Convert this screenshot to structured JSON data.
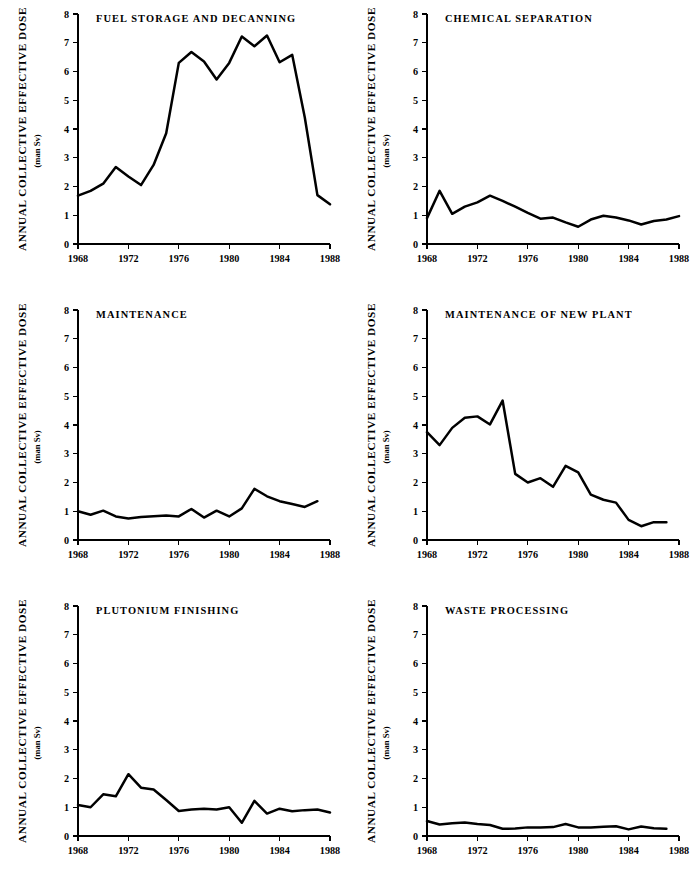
{
  "figure": {
    "panel_count": 6,
    "axis_label_y": "ANNUAL  COLLECTIVE  EFFECTIVE  DOSE",
    "axis_label_y_units": "(man Sv)",
    "y_ticks": [
      "0",
      "1",
      "2",
      "3",
      "4",
      "5",
      "6",
      "7",
      "8"
    ],
    "x_ticks": [
      "1968",
      "1972",
      "1976",
      "1980",
      "1984",
      "1988"
    ],
    "line_color": "#000000",
    "background_color": "#ffffff"
  },
  "chart_data": [
    {
      "type": "line",
      "title": "FUEL STORAGE AND DECANNING",
      "xlabel": "",
      "ylabel": "ANNUAL  COLLECTIVE  EFFECTIVE  DOSE (man Sv)",
      "xlim": [
        1968,
        1988
      ],
      "ylim": [
        0,
        8
      ],
      "grid": false,
      "legend": "none",
      "x": [
        1968,
        1969,
        1970,
        1971,
        1972,
        1973,
        1974,
        1975,
        1976,
        1977,
        1978,
        1979,
        1980,
        1981,
        1982,
        1983,
        1984,
        1985,
        1986,
        1987,
        1988
      ],
      "values": [
        1.68,
        1.85,
        2.1,
        2.68,
        2.35,
        2.05,
        2.75,
        3.85,
        6.3,
        6.68,
        6.35,
        5.72,
        6.3,
        7.22,
        6.88,
        7.25,
        6.32,
        6.58,
        4.4,
        1.7,
        1.38
      ]
    },
    {
      "type": "line",
      "title": "CHEMICAL SEPARATION",
      "xlabel": "",
      "ylabel": "ANNUAL  COLLECTIVE  EFFECTIVE  DOSE (man Sv)",
      "xlim": [
        1968,
        1988
      ],
      "ylim": [
        0,
        8
      ],
      "grid": false,
      "legend": "none",
      "x": [
        1968,
        1969,
        1970,
        1971,
        1972,
        1973,
        1974,
        1975,
        1976,
        1977,
        1978,
        1979,
        1980,
        1981,
        1982,
        1983,
        1984,
        1985,
        1986,
        1987,
        1988
      ],
      "values": [
        0.9,
        1.85,
        1.05,
        1.3,
        1.45,
        1.68,
        1.5,
        1.3,
        1.08,
        0.88,
        0.92,
        0.75,
        0.6,
        0.85,
        0.98,
        0.92,
        0.82,
        0.68,
        0.8,
        0.85,
        0.97
      ]
    },
    {
      "type": "line",
      "title": "MAINTENANCE",
      "xlabel": "",
      "ylabel": "ANNUAL  COLLECTIVE  EFFECTIVE  DOSE (man Sv)",
      "xlim": [
        1968,
        1988
      ],
      "ylim": [
        0,
        8
      ],
      "grid": false,
      "legend": "none",
      "x": [
        1968,
        1969,
        1970,
        1971,
        1972,
        1973,
        1974,
        1975,
        1976,
        1977,
        1978,
        1979,
        1980,
        1981,
        1982,
        1983,
        1984,
        1985,
        1986,
        1987
      ],
      "values": [
        1.0,
        0.88,
        1.02,
        0.82,
        0.75,
        0.8,
        0.83,
        0.85,
        0.82,
        1.08,
        0.78,
        1.02,
        0.82,
        1.1,
        1.78,
        1.52,
        1.35,
        1.25,
        1.15,
        1.35
      ]
    },
    {
      "type": "line",
      "title": "MAINTENANCE OF NEW PLANT",
      "xlabel": "",
      "ylabel": "ANNUAL  COLLECTIVE  EFFECTIVE  DOSE (man Sv)",
      "xlim": [
        1968,
        1988
      ],
      "ylim": [
        0,
        8
      ],
      "grid": false,
      "legend": "none",
      "x": [
        1968,
        1969,
        1970,
        1971,
        1972,
        1973,
        1974,
        1975,
        1976,
        1977,
        1978,
        1979,
        1980,
        1981,
        1982,
        1983,
        1984,
        1985,
        1986,
        1987
      ],
      "values": [
        3.75,
        3.3,
        3.9,
        4.25,
        4.3,
        4.02,
        4.85,
        2.3,
        2.0,
        2.15,
        1.85,
        2.58,
        2.35,
        1.58,
        1.4,
        1.3,
        0.7,
        0.48,
        0.62,
        0.62
      ]
    },
    {
      "type": "line",
      "title": "PLUTONIUM FINISHING",
      "xlabel": "",
      "ylabel": "ANNUAL  COLLECTIVE  EFFECTIVE  DOSE (man Sv)",
      "xlim": [
        1968,
        1988
      ],
      "ylim": [
        0,
        8
      ],
      "grid": false,
      "legend": "none",
      "x": [
        1968,
        1969,
        1970,
        1971,
        1972,
        1973,
        1974,
        1975,
        1976,
        1977,
        1978,
        1979,
        1980,
        1981,
        1982,
        1983,
        1984,
        1985,
        1986,
        1987,
        1988
      ],
      "values": [
        1.08,
        1.0,
        1.45,
        1.38,
        2.15,
        1.68,
        1.62,
        1.25,
        0.87,
        0.92,
        0.95,
        0.92,
        1.0,
        0.46,
        1.22,
        0.78,
        0.95,
        0.86,
        0.9,
        0.92,
        0.82
      ]
    },
    {
      "type": "line",
      "title": "WASTE PROCESSING",
      "xlabel": "",
      "ylabel": "ANNUAL  COLLECTIVE  EFFECTIVE  DOSE (man Sv)",
      "xlim": [
        1968,
        1988
      ],
      "ylim": [
        0,
        8
      ],
      "grid": false,
      "legend": "none",
      "x": [
        1968,
        1969,
        1970,
        1971,
        1972,
        1973,
        1974,
        1975,
        1976,
        1977,
        1978,
        1979,
        1980,
        1981,
        1982,
        1983,
        1984,
        1985,
        1986,
        1987
      ],
      "values": [
        0.52,
        0.4,
        0.44,
        0.47,
        0.42,
        0.38,
        0.25,
        0.26,
        0.3,
        0.3,
        0.31,
        0.42,
        0.3,
        0.3,
        0.32,
        0.34,
        0.23,
        0.33,
        0.27,
        0.25
      ]
    }
  ]
}
